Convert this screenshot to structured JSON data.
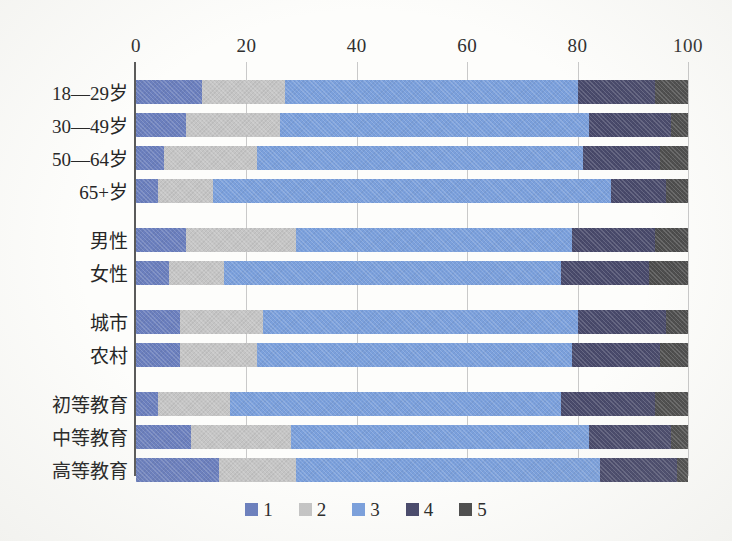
{
  "chart_data": {
    "type": "bar",
    "subtype": "stacked-horizontal-100",
    "title": "",
    "xlabel": "",
    "ylabel": "",
    "xlim": [
      0,
      100
    ],
    "xticks": [
      0,
      20,
      40,
      60,
      80,
      100
    ],
    "grid": true,
    "legend_position": "bottom",
    "legend": [
      "1",
      "2",
      "3",
      "4",
      "5"
    ],
    "series_colors": [
      "#6b7fbe",
      "#c5c5c5",
      "#7ba0dc",
      "#494a6b",
      "#4d4d4d"
    ],
    "categories": [
      "18—29岁",
      "30—49岁",
      "50—64岁",
      "65+岁",
      "男性",
      "女性",
      "城市",
      "农村",
      "初等教育",
      "中等教育",
      "高等教育"
    ],
    "category_groups": [
      {
        "name": "年龄",
        "categories": [
          "18—29岁",
          "30—49岁",
          "50—64岁",
          "65+岁"
        ]
      },
      {
        "name": "性别",
        "categories": [
          "男性",
          "女性"
        ]
      },
      {
        "name": "居住地",
        "categories": [
          "城市",
          "农村"
        ]
      },
      {
        "name": "教育程度",
        "categories": [
          "初等教育",
          "中等教育",
          "高等教育"
        ]
      }
    ],
    "series": [
      {
        "name": "1",
        "values": [
          12,
          9,
          5,
          4,
          9,
          6,
          8,
          8,
          4,
          10,
          15
        ]
      },
      {
        "name": "2",
        "values": [
          15,
          17,
          17,
          10,
          20,
          10,
          15,
          14,
          13,
          18,
          14
        ]
      },
      {
        "name": "3",
        "values": [
          53,
          56,
          59,
          72,
          50,
          61,
          57,
          57,
          60,
          54,
          55
        ]
      },
      {
        "name": "4",
        "values": [
          14,
          15,
          14,
          10,
          15,
          16,
          16,
          16,
          17,
          15,
          14
        ]
      },
      {
        "name": "5",
        "values": [
          6,
          3,
          5,
          4,
          6,
          7,
          4,
          5,
          6,
          3,
          2
        ]
      }
    ],
    "rows": [
      {
        "label": "18—29岁",
        "values": [
          12,
          15,
          53,
          14,
          6
        ],
        "cumulative": [
          12,
          27,
          80,
          94,
          100
        ]
      },
      {
        "label": "30—49岁",
        "values": [
          9,
          17,
          56,
          15,
          3
        ],
        "cumulative": [
          9,
          26,
          82,
          97,
          100
        ]
      },
      {
        "label": "50—64岁",
        "values": [
          5,
          17,
          59,
          14,
          5
        ],
        "cumulative": [
          5,
          22,
          81,
          95,
          100
        ]
      },
      {
        "label": "65+岁",
        "values": [
          4,
          10,
          72,
          10,
          4
        ],
        "cumulative": [
          4,
          14,
          86,
          96,
          100
        ]
      },
      {
        "label": "男性",
        "values": [
          9,
          20,
          50,
          15,
          6
        ],
        "cumulative": [
          9,
          29,
          79,
          94,
          100
        ]
      },
      {
        "label": "女性",
        "values": [
          6,
          10,
          61,
          16,
          7
        ],
        "cumulative": [
          6,
          16,
          77,
          93,
          100
        ]
      },
      {
        "label": "城市",
        "values": [
          8,
          15,
          57,
          16,
          4
        ],
        "cumulative": [
          8,
          23,
          80,
          96,
          100
        ]
      },
      {
        "label": "农村",
        "values": [
          8,
          14,
          57,
          16,
          5
        ],
        "cumulative": [
          8,
          22,
          79,
          95,
          100
        ]
      },
      {
        "label": "初等教育",
        "values": [
          4,
          13,
          60,
          17,
          6
        ],
        "cumulative": [
          4,
          17,
          77,
          94,
          100
        ]
      },
      {
        "label": "中等教育",
        "values": [
          10,
          18,
          54,
          15,
          3
        ],
        "cumulative": [
          10,
          28,
          82,
          97,
          100
        ]
      },
      {
        "label": "高等教育",
        "values": [
          15,
          14,
          55,
          14,
          2
        ],
        "cumulative": [
          15,
          29,
          84,
          98,
          100
        ]
      }
    ]
  },
  "layout": {
    "row_tops": [
      14,
      47,
      80,
      113,
      162,
      195,
      244,
      277,
      326,
      359,
      392
    ],
    "row_height": 26,
    "bar_height": 24
  }
}
